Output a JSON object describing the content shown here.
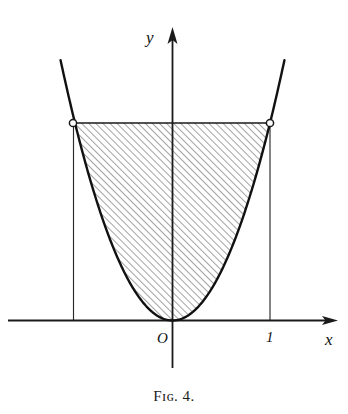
{
  "figure": {
    "caption": "Fɪɢ. 4.",
    "background_color": "#ffffff",
    "ink_color": "#111111",
    "axes": {
      "x_axis_label": "x",
      "y_axis_label": "y",
      "origin_label": "O",
      "x_ticks": [
        {
          "label": "1",
          "value": 1
        }
      ],
      "y_ticks": []
    },
    "curve": {
      "name": "parabola",
      "description": "y = x squared",
      "endpoint_left_x": -1,
      "endpoint_right_x": 1,
      "endpoint_y": 1,
      "vertex_x": 0,
      "vertex_y": 0
    },
    "markers": [
      {
        "name": "open-circle-left",
        "x": -1,
        "y": 1,
        "filled": false
      },
      {
        "name": "open-circle-right",
        "x": 1,
        "y": 1,
        "filled": false
      }
    ],
    "region": {
      "name": "hatched-area",
      "fill": "diagonal-hatching",
      "hatch_angle_degrees": 45,
      "hatch_spacing_px": 5,
      "hatch_color": "#333333",
      "bounded_below_by": "parabola",
      "bounded_above_by": "horizontal line y = 1",
      "bounded_left_by": "vertical line x = -1",
      "bounded_right_by": "vertical line x = 1"
    }
  },
  "chart_data": {
    "type": "line",
    "title": "Fɪɢ. 4.",
    "xlabel": "x",
    "ylabel": "y",
    "xlim": [
      -1.65,
      1.65
    ],
    "ylim": [
      -0.5,
      1.48
    ],
    "grid": false,
    "legend": null,
    "series": [
      {
        "name": "y = x^2",
        "equation": "y = x^2",
        "x": [
          -1.15,
          -1.0,
          -0.875,
          -0.75,
          -0.625,
          -0.5,
          -0.375,
          -0.25,
          -0.125,
          0.0,
          0.125,
          0.25,
          0.375,
          0.5,
          0.625,
          0.75,
          0.875,
          1.0,
          1.15
        ],
        "y": [
          1.3225,
          1.0,
          0.7656,
          0.5625,
          0.3906,
          0.25,
          0.1406,
          0.0625,
          0.0156,
          0.0,
          0.0156,
          0.0625,
          0.1406,
          0.25,
          0.3906,
          0.5625,
          0.7656,
          1.0,
          1.3225
        ]
      },
      {
        "name": "top boundary y = 1",
        "x": [
          -1.0,
          1.0
        ],
        "y": [
          1.0,
          1.0
        ]
      },
      {
        "name": "left boundary x = -1",
        "x": [
          -1.0,
          -1.0
        ],
        "y": [
          0.0,
          1.0
        ]
      },
      {
        "name": "right boundary x = 1",
        "x": [
          1.0,
          1.0
        ],
        "y": [
          0.0,
          1.0
        ]
      }
    ],
    "annotations": [
      {
        "text": "O",
        "x": -0.08,
        "y": -0.18
      },
      {
        "text": "1",
        "x": 1.0,
        "y": -0.18
      },
      {
        "text": "x",
        "x": 1.62,
        "y": -0.2
      },
      {
        "text": "y",
        "x": -0.16,
        "y": 1.45
      }
    ],
    "markers": [
      {
        "x": -1.0,
        "y": 1.0,
        "style": "open-circle"
      },
      {
        "x": 1.0,
        "y": 1.0,
        "style": "open-circle"
      }
    ],
    "shaded_regions": [
      {
        "name": "area between parabola and y = 1",
        "x_range": [
          -1.0,
          1.0
        ],
        "lower": "y = x^2",
        "upper": "y = 1",
        "style": "diagonal-hatch"
      }
    ]
  }
}
